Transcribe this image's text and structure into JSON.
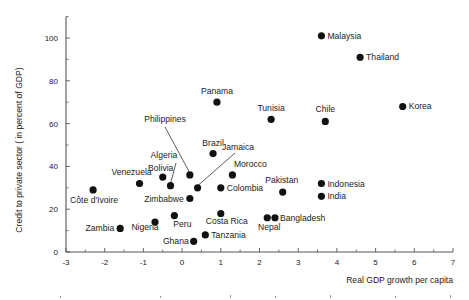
{
  "chart_data": {
    "type": "scatter",
    "title": "",
    "xlabel": "Real GDP growth per capita",
    "ylabel": "Credit to private sector ( in percent of GDP)",
    "xlim": [
      -3,
      7
    ],
    "ylim": [
      0,
      110
    ],
    "x_ticks": [
      -3,
      -2,
      -1,
      0,
      1,
      2,
      3,
      4,
      5,
      6,
      7
    ],
    "y_ticks": [
      0,
      20,
      40,
      60,
      80,
      100
    ],
    "grid": false,
    "legend": null,
    "marker_color": "#111111",
    "points": [
      {
        "label": "Malaysia",
        "x": 3.6,
        "y": 101,
        "label_pos": "right"
      },
      {
        "label": "Thailand",
        "x": 4.6,
        "y": 91,
        "label_pos": "right"
      },
      {
        "label": "Korea",
        "x": 5.7,
        "y": 68,
        "label_pos": "right"
      },
      {
        "label": "Chile",
        "x": 3.7,
        "y": 61,
        "label_pos": "above"
      },
      {
        "label": "Tunisia",
        "x": 2.3,
        "y": 62,
        "label_pos": "above"
      },
      {
        "label": "Panama",
        "x": 0.9,
        "y": 70,
        "label_pos": "above"
      },
      {
        "label": "Brazil",
        "x": 0.8,
        "y": 46,
        "label_pos": "above"
      },
      {
        "label": "Philippines",
        "x": 0.2,
        "y": 36,
        "label_pos": "leader"
      },
      {
        "label": "Jamaica",
        "x": 0.4,
        "y": 30,
        "label_pos": "leader"
      },
      {
        "label": "Algeria",
        "x": -0.3,
        "y": 31,
        "label_pos": "leader"
      },
      {
        "label": "Bolivia",
        "x": -0.5,
        "y": 35,
        "label_pos": "above"
      },
      {
        "label": "Zimbabwe",
        "x": 0.2,
        "y": 25,
        "label_pos": "left"
      },
      {
        "label": "Morocco",
        "x": 1.3,
        "y": 36,
        "label_pos": "above"
      },
      {
        "label": "Colombia",
        "x": 1.0,
        "y": 30,
        "label_pos": "right"
      },
      {
        "label": "Venezuela",
        "x": -1.1,
        "y": 32,
        "label_pos": "above"
      },
      {
        "label": "Côte d'Ivoire",
        "x": -2.3,
        "y": 29,
        "label_pos": "below"
      },
      {
        "label": "Zambia",
        "x": -1.6,
        "y": 11,
        "label_pos": "left"
      },
      {
        "label": "Nigeria",
        "x": -0.7,
        "y": 14,
        "label_pos": "below"
      },
      {
        "label": "Peru",
        "x": -0.2,
        "y": 17,
        "label_pos": "below"
      },
      {
        "label": "Costa Rica",
        "x": 1.0,
        "y": 18,
        "label_pos": "below"
      },
      {
        "label": "Tanzania",
        "x": 0.6,
        "y": 8,
        "label_pos": "right"
      },
      {
        "label": "Ghana",
        "x": 0.3,
        "y": 5,
        "label_pos": "left"
      },
      {
        "label": "Nepal",
        "x": 2.2,
        "y": 16,
        "label_pos": "below"
      },
      {
        "label": "Bangladesh",
        "x": 2.4,
        "y": 16,
        "label_pos": "right"
      },
      {
        "label": "Pakistan",
        "x": 2.6,
        "y": 28,
        "label_pos": "above"
      },
      {
        "label": "Indonesia",
        "x": 3.6,
        "y": 32,
        "label_pos": "right"
      },
      {
        "label": "India",
        "x": 3.6,
        "y": 26,
        "label_pos": "right"
      }
    ]
  }
}
